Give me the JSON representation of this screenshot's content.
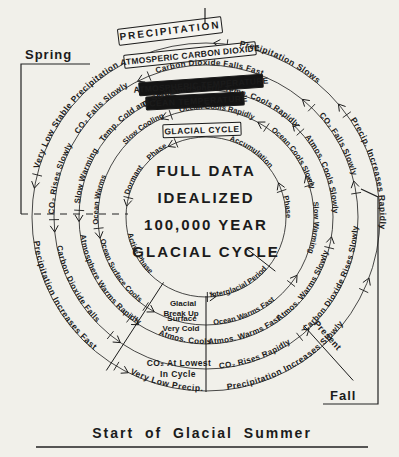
{
  "figure": {
    "paper": "#f1f0ea",
    "ink": "#1b1b1b",
    "center": [
      206,
      217
    ],
    "title_lines": [
      "FULL DATA",
      "IDEALIZED",
      "100,000 YEAR",
      "GLACIAL CYCLE"
    ],
    "season_labels": {
      "spring": "Spring",
      "fall": "Fall",
      "present": "Present",
      "bottom": "Start of Glacial Summer"
    },
    "rings": [
      {
        "name": "glacial-cycle",
        "r": 80,
        "fs": 7.5,
        "ls": 0,
        "box": {
          "label": "GLACIAL CYCLE",
          "cx": 202,
          "cy": 130,
          "w": 78,
          "h": 13,
          "rot": -2,
          "style": "outline",
          "fs": 8.5,
          "lsp": 0.5
        },
        "labels": [
          {
            "t": "Dormant",
            "d": "cw",
            "a": 196
          },
          {
            "t": "Phase",
            "d": "cw",
            "a": 225
          },
          {
            "t": "Accumulation",
            "d": "cw",
            "a": 287
          },
          {
            "t": "Phase",
            "d": "cw",
            "a": 345
          },
          {
            "t": "Active  Phase",
            "d": "ccw",
            "a": 168
          },
          {
            "t": "Interglacial Period",
            "d": "ccw",
            "a": 87
          },
          {
            "t": "Glacial",
            "d": "h",
            "x": 183,
            "y": 306
          },
          {
            "t": "Break Up",
            "d": "h",
            "x": 181,
            "y": 316
          }
        ],
        "marks": [
          194,
          248,
          341,
          89
        ]
      },
      {
        "name": "ocean-temperature",
        "r": 108,
        "fs": 7.5,
        "ls": 0,
        "box": {
          "label": "OCEAN TEMPERATURE",
          "cx": 195,
          "cy": 101,
          "w": 98,
          "h": 13,
          "rot": -3,
          "style": "inverse",
          "fs": 8.5,
          "lsp": 0.5
        },
        "labels": [
          {
            "t": "Ocean Warms",
            "d": "cw",
            "a": 176
          },
          {
            "t": "Slow Cooling",
            "d": "cw",
            "a": 222
          },
          {
            "t": "Ocean Cools Rapidly",
            "d": "cw",
            "a": 256
          },
          {
            "t": "Ocean Cools Slowly",
            "d": "cw",
            "a": 307
          },
          {
            "t": "Slow Warming",
            "d": "cw",
            "a": 352
          },
          {
            "t": "Ocean Surface Cools",
            "d": "ccw",
            "a": 168
          },
          {
            "t": "Ocean Warms Fast",
            "d": "ccw",
            "a": 86
          },
          {
            "t": "Surface",
            "d": "h",
            "x": 182,
            "y": 321
          },
          {
            "t": "Very Cold",
            "d": "h",
            "x": 181,
            "y": 331
          }
        ],
        "marks": [
          174,
          251,
          304,
          343,
          38,
          124
        ]
      },
      {
        "name": "atmospheric-temperature",
        "r": 127,
        "fs": 8,
        "ls": 0.2,
        "box": {
          "label": "ATMOSPHERIC TEMPERATURE",
          "cx": 201,
          "cy": 85,
          "w": 124,
          "h": 13,
          "rot": -4,
          "style": "inverse",
          "fs": 8.5,
          "lsp": 0.3
        },
        "labels": [
          {
            "t": "Slow Warming",
            "d": "cw",
            "a": 186
          },
          {
            "t": "Temp. Cold and Stable",
            "d": "cw",
            "a": 216
          },
          {
            "t": "Atmospheric Temp. Cools Rapidly",
            "d": "cw",
            "a": 254
          },
          {
            "t": "Atmos. Cools Slowly",
            "d": "cw",
            "a": 321
          },
          {
            "t": "Atmosphere Warms Rapidly",
            "d": "ccw",
            "a": 172
          },
          {
            "t": "Atmos. Cools",
            "d": "ccw",
            "a": 112
          },
          {
            "t": "Atmos. Warms Fast",
            "d": "ccw",
            "a": 89
          },
          {
            "t": "Atmos. Warms Slowly",
            "d": "ccw",
            "a": 55
          }
        ],
        "marks": [
          183,
          252,
          318,
          14,
          127
        ]
      },
      {
        "name": "atmospheric-carbon-dioxide",
        "r": 152,
        "fs": 8,
        "ls": 0.4,
        "box": {
          "label": "ATMOSPERIC CARBON DIOXIDE",
          "cx": 190,
          "cy": 55,
          "w": 132,
          "h": 13,
          "rot": -6,
          "style": "outline",
          "fs": 8.5,
          "lsp": 0.3
        },
        "labels": [
          {
            "t": "CO₂ Rises Slowly",
            "d": "cw",
            "a": 181
          },
          {
            "t": "CO₂ Falls Slowly",
            "d": "cw",
            "a": 213
          },
          {
            "t": "Carbon Dioxide  Falls Fast",
            "d": "cw",
            "a": 251
          },
          {
            "t": "CO₂ Falls Slowly",
            "d": "cw",
            "a": 318
          },
          {
            "t": "Carbon Dioxide Falls",
            "d": "ccw",
            "a": 169
          },
          {
            "t": "CO₂ Rises Rapidly",
            "d": "ccw",
            "a": 85
          },
          {
            "t": "Carbon Dioxide Rises Slowly",
            "d": "ccw",
            "a": 49
          },
          {
            "t": "CO₂ At Lowest",
            "d": "h",
            "x": 179,
            "y": 366
          },
          {
            "t": "In  Cycle",
            "d": "h",
            "x": 178,
            "y": 377
          }
        ],
        "marks": [
          179,
          248,
          314,
          351,
          129,
          52
        ]
      },
      {
        "name": "precipitation",
        "r": 174,
        "fs": 8.5,
        "ls": 0.5,
        "box": {
          "label": "PRECIPITATION",
          "cx": 170,
          "cy": 31,
          "w": 104,
          "h": 16,
          "rot": -7,
          "style": "outline",
          "fs": 10,
          "lsp": 2
        },
        "labels": [
          {
            "t": "Very Low Stable Precipitation",
            "d": "cw",
            "a": 196
          },
          {
            "t": "Precipitation  Slows",
            "d": "cw",
            "a": 281
          },
          {
            "t": "Precip. Increases Rapidly",
            "d": "cw",
            "a": 326
          },
          {
            "t": "Precipitation Increases Fast",
            "d": "ccw",
            "a": 172
          },
          {
            "t": "Very Low Precip.",
            "d": "ccw",
            "a": 116
          },
          {
            "t": "Precipitation Increases Slowly",
            "d": "ccw",
            "a": 83
          }
        ],
        "marks": [
          194,
          277,
          324,
          121,
          25
        ]
      }
    ],
    "radials": [
      {
        "a": 123,
        "r0": 78,
        "r1": 183
      },
      {
        "a": 38,
        "r0": 52,
        "r1": 88
      },
      {
        "a": 48,
        "r0": 146,
        "r1": 220
      }
    ]
  }
}
